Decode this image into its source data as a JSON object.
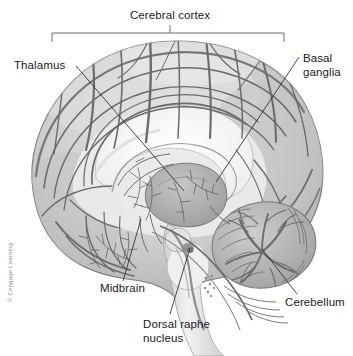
{
  "figure": {
    "title_label": "Cerebral cortex",
    "credit": "© Cengage Learning",
    "palette": {
      "background": "#ffffff",
      "cortex_light": "#d9d9d9",
      "cortex_mid": "#bdbdbd",
      "cortex_dark": "#9a9a9a",
      "sulci_line": "#6e6e6e",
      "white_matter": "#f4f4f4",
      "corpus_callosum": "#fbfbfb",
      "brainstem": "#e6e6e6",
      "cerebellum": "#b5b5b5",
      "label_text": "#1a1a1a",
      "leader_line": "#2b2b2b",
      "bracket_line": "#5a5a5a"
    },
    "bracket": {
      "x_start": 52,
      "x_end": 284,
      "y": 33,
      "tick_center_x": 170
    },
    "labels": [
      {
        "id": "cerebral-cortex",
        "text": "Cerebral cortex",
        "lines": [
          "Cerebral cortex"
        ],
        "x": 170,
        "y": 19,
        "anchor": "middle"
      },
      {
        "id": "thalamus",
        "text": "Thalamus",
        "lines": [
          "Thalamus"
        ],
        "x": 14,
        "y": 69,
        "anchor": "start"
      },
      {
        "id": "basal-ganglia",
        "text": "Basal ganglia",
        "lines": [
          "Basal",
          "ganglia"
        ],
        "x": 303,
        "y": 62,
        "anchor": "start"
      },
      {
        "id": "midbrain",
        "text": "Midbrain",
        "lines": [
          "Midbrain"
        ],
        "x": 100,
        "y": 292,
        "anchor": "start"
      },
      {
        "id": "dorsal-raphe-nucleus",
        "text": "Dorsal raphe nucleus",
        "lines": [
          "Dorsal raphe",
          "nucleus"
        ],
        "x": 143,
        "y": 328,
        "anchor": "start"
      },
      {
        "id": "cerebellum",
        "text": "Cerebellum",
        "lines": [
          "Cerebellum"
        ],
        "x": 285,
        "y": 306,
        "anchor": "start"
      }
    ]
  }
}
